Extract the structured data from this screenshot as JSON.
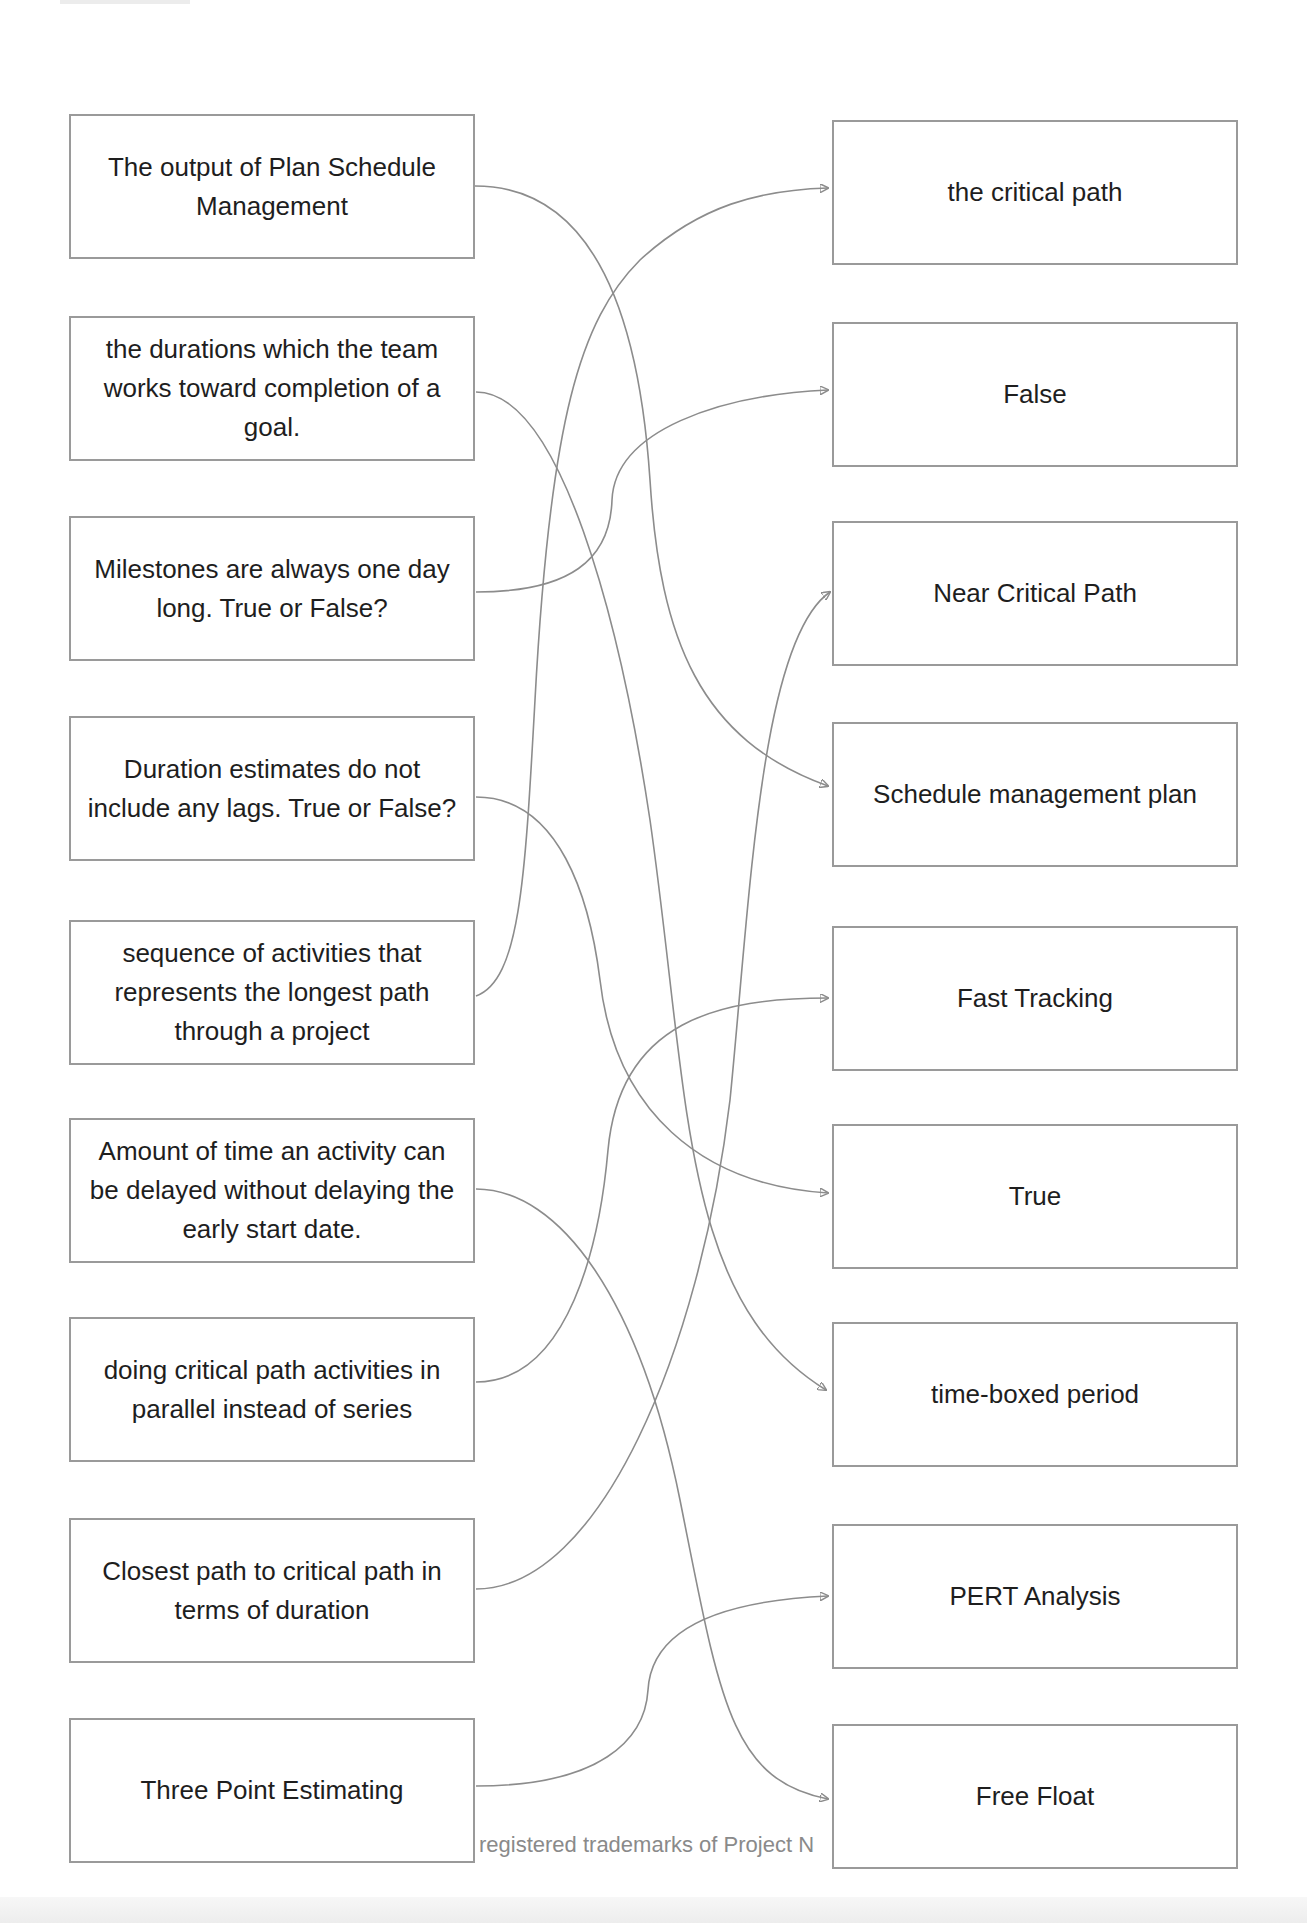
{
  "diagram": {
    "type": "matching-exercise",
    "left_items": [
      {
        "id": "L1",
        "text": "The output of Plan Schedule Management",
        "matches": "R4"
      },
      {
        "id": "L2",
        "text": "the durations which the team works toward completion of a goal.",
        "matches": "R7"
      },
      {
        "id": "L3",
        "text": "Milestones are always one day long. True or False?",
        "matches": "R2"
      },
      {
        "id": "L4",
        "text": "Duration estimates do not include any lags. True or False?",
        "matches": "R6"
      },
      {
        "id": "L5",
        "text": "sequence of activities that represents the longest path through a project",
        "matches": "R1"
      },
      {
        "id": "L6",
        "text": "Amount of time an activity can be delayed without delaying the early start date.",
        "matches": "R9"
      },
      {
        "id": "L7",
        "text": "doing critical path activities in parallel instead of series",
        "matches": "R5"
      },
      {
        "id": "L8",
        "text": "Closest path to critical path in terms of duration",
        "matches": "R3"
      },
      {
        "id": "L9",
        "text": "Three Point Estimating",
        "matches": "R8"
      }
    ],
    "right_items": [
      {
        "id": "R1",
        "text": "the critical path"
      },
      {
        "id": "R2",
        "text": "False"
      },
      {
        "id": "R3",
        "text": "Near Critical Path"
      },
      {
        "id": "R4",
        "text": "Schedule management plan"
      },
      {
        "id": "R5",
        "text": "Fast Tracking"
      },
      {
        "id": "R6",
        "text": "True"
      },
      {
        "id": "R7",
        "text": "time-boxed period"
      },
      {
        "id": "R8",
        "text": "PERT Analysis"
      },
      {
        "id": "R9",
        "text": "Free Float"
      }
    ],
    "connections": [
      {
        "from": "L1",
        "to": "R4"
      },
      {
        "from": "L2",
        "to": "R7"
      },
      {
        "from": "L3",
        "to": "R2"
      },
      {
        "from": "L4",
        "to": "R6"
      },
      {
        "from": "L5",
        "to": "R1"
      },
      {
        "from": "L6",
        "to": "R9"
      },
      {
        "from": "L7",
        "to": "R5"
      },
      {
        "from": "L8",
        "to": "R3"
      },
      {
        "from": "L9",
        "to": "R8"
      }
    ],
    "line_color": "#8c8c8c",
    "box_border_color": "#9a9a9a"
  },
  "footer": {
    "text": "registered trademarks of Project N"
  }
}
